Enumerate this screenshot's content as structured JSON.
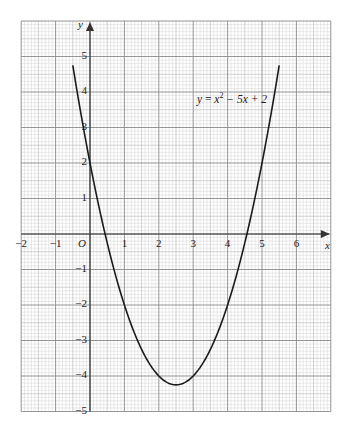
{
  "chart_data": {
    "type": "line",
    "title": "",
    "xlabel": "x",
    "ylabel": "y",
    "origin_label": "O",
    "xlim": [
      -2,
      7
    ],
    "ylim": [
      -5,
      6
    ],
    "grid": true,
    "grid_minor_divisions": 10,
    "x_ticks": [
      -2,
      -1,
      1,
      2,
      3,
      4,
      5,
      6
    ],
    "y_ticks": [
      -5,
      -4,
      -3,
      -2,
      -1,
      1,
      2,
      3,
      4,
      5
    ],
    "series": [
      {
        "name": "y = x² − 5x + 2",
        "equation": "y = x^2 - 5x + 2",
        "coefficients": {
          "a": 1,
          "b": -5,
          "c": 2
        },
        "x_range": [
          -0.5,
          5.5
        ],
        "x": [
          -0.5,
          0,
          0.5,
          1,
          1.5,
          2,
          2.5,
          3,
          3.5,
          4,
          4.5,
          5,
          5.5
        ],
        "y": [
          4.75,
          2,
          -0.25,
          -2,
          -3.25,
          -4,
          -4.25,
          -4,
          -3.25,
          -2,
          -0.25,
          2,
          4.75
        ],
        "color": "#1a1a1a"
      }
    ],
    "annotations": [
      {
        "text": "y = x² − 5x + 2",
        "x": 3.1,
        "y": 3.8
      }
    ]
  },
  "labels": {
    "x_axis": "x",
    "y_axis": "y",
    "origin": "O",
    "equation_y": "y",
    "equation_eq": " = ",
    "equation_x": "x",
    "equation_sup": "2",
    "equation_rest": " − 5x + 2"
  },
  "colors": {
    "minor_grid": "#d4d4d4",
    "half_grid": "#b5b5b5",
    "major_grid": "#8a8a8a",
    "axis": "#333333",
    "curve": "#1a1a1a"
  }
}
